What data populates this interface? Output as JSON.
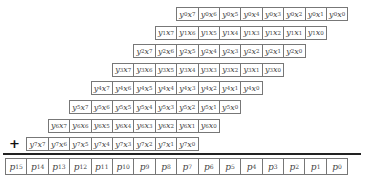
{
  "diagram": {
    "operator": "+",
    "partial_product_rows": [
      {
        "y": "0",
        "cells": [
          "7",
          "6",
          "5",
          "4",
          "3",
          "2",
          "1",
          "0"
        ]
      },
      {
        "y": "1",
        "cells": [
          "7",
          "6",
          "5",
          "4",
          "3",
          "2",
          "1",
          "0"
        ]
      },
      {
        "y": "2",
        "cells": [
          "7",
          "6",
          "5",
          "4",
          "3",
          "2",
          "1",
          "0"
        ]
      },
      {
        "y": "3",
        "cells": [
          "7",
          "6",
          "5",
          "4",
          "3",
          "2",
          "1",
          "0"
        ]
      },
      {
        "y": "4",
        "cells": [
          "7",
          "6",
          "5",
          "4",
          "3",
          "2",
          "1",
          "0"
        ]
      },
      {
        "y": "5",
        "cells": [
          "7",
          "6",
          "5",
          "4",
          "3",
          "2",
          "1",
          "0"
        ]
      },
      {
        "y": "6",
        "cells": [
          "7",
          "6",
          "5",
          "4",
          "3",
          "2",
          "1",
          "0"
        ]
      },
      {
        "y": "7",
        "cells": [
          "7",
          "6",
          "5",
          "4",
          "3",
          "2",
          "1",
          "0"
        ]
      }
    ],
    "product_bits": [
      "15",
      "14",
      "13",
      "12",
      "11",
      "10",
      "9",
      "8",
      "7",
      "6",
      "5",
      "4",
      "3",
      "2",
      "1",
      "0"
    ]
  }
}
